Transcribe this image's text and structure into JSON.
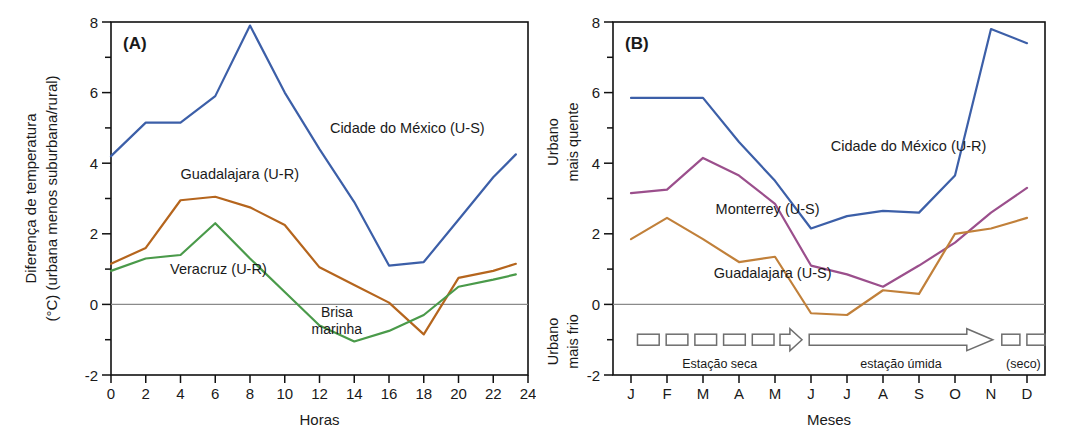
{
  "figure": {
    "panels": [
      "A",
      "B"
    ]
  },
  "panel_a": {
    "tag": "(A)",
    "ylabel_line1": "Diferença de temperatura",
    "ylabel_line2": "(°C) (urbana menos suburbana/rural)",
    "xlabel": "Horas",
    "yticks": [
      -2,
      0,
      2,
      4,
      6,
      8
    ],
    "yticks_minor": [
      -1,
      1,
      3,
      5,
      7
    ],
    "xticks": [
      0,
      2,
      4,
      6,
      8,
      10,
      12,
      14,
      16,
      18,
      20,
      22,
      24
    ],
    "ylim": [
      -2,
      8
    ],
    "xlim": [
      0,
      24
    ],
    "annotation": {
      "line1": "Brisa",
      "line2": "marinha",
      "x": 13.0,
      "y": -0.35
    },
    "series_labels": [
      {
        "text": "Cidade do México (U-S)",
        "x": 12.6,
        "y": 4.85
      },
      {
        "text": "Guadalajara (U-R)",
        "x": 4.0,
        "y": 3.55
      },
      {
        "text": "Veracruz (U-R)",
        "x": 3.4,
        "y": 0.85
      }
    ]
  },
  "panel_b": {
    "tag": "(B)",
    "ylabel_top_line1": "Urbano",
    "ylabel_top_line2": "mais quente",
    "ylabel_bottom_line1": "Urbano",
    "ylabel_bottom_line2": "mais frio",
    "xlabel": "Meses",
    "yticks": [
      -2,
      0,
      2,
      4,
      6,
      8
    ],
    "yticks_minor": [
      -1,
      1,
      3,
      5,
      7
    ],
    "xticks": [
      "J",
      "F",
      "M",
      "A",
      "M",
      "J",
      "J",
      "A",
      "S",
      "O",
      "N",
      "D"
    ],
    "ylim": [
      -2,
      8
    ],
    "series_labels": [
      {
        "text": "Cidade do México (U-R)",
        "x": 5.55,
        "y": 4.35
      },
      {
        "text": "Monterrey (U-S)",
        "x": 2.35,
        "y": 2.55
      },
      {
        "text": "Guadalajara (U-S)",
        "x": 2.3,
        "y": 0.75
      }
    ],
    "seasons": [
      {
        "name": "Estação seca",
        "type": "dashed-arrow",
        "x_start": 0.18,
        "x_end": 4.75,
        "dashes": 5
      },
      {
        "name": "estação úmida",
        "type": "solid-arrow",
        "x_start": 4.95,
        "x_end": 10.05,
        "dashes": 0
      },
      {
        "name": "(seco)",
        "type": "dashes",
        "x_start": 10.3,
        "x_end": 11.5,
        "dashes": 2
      }
    ],
    "season_band_y": -1.0
  },
  "chart_data": [
    {
      "type": "line",
      "panel": "A",
      "title": "(A) Diferença de temperatura urbana ao longo do dia",
      "xlabel": "Horas",
      "ylabel": "Diferença de temperatura (°C) (urbana menos suburbana/rural)",
      "xlim": [
        0,
        24
      ],
      "ylim": [
        -2,
        8
      ],
      "grid": false,
      "legend": "inline-annotations",
      "x": [
        0,
        2,
        4,
        6,
        8,
        10,
        12,
        14,
        16,
        18,
        20,
        22,
        23.3
      ],
      "series": [
        {
          "name": "Cidade do México (U-S)",
          "color": "#3c5fa8",
          "values": [
            4.2,
            5.15,
            5.15,
            5.9,
            7.9,
            6.0,
            4.4,
            2.9,
            1.1,
            1.2,
            2.4,
            3.6,
            4.25
          ]
        },
        {
          "name": "Guadalajara (U-R)",
          "color": "#b5651d",
          "values": [
            1.15,
            1.6,
            2.95,
            3.05,
            2.75,
            2.25,
            1.05,
            0.55,
            0.05,
            -0.85,
            0.75,
            0.95,
            1.15
          ]
        },
        {
          "name": "Veracruz (U-R)",
          "color": "#4a9a4a",
          "values": [
            0.95,
            1.3,
            1.4,
            2.3,
            1.3,
            0.35,
            -0.6,
            -1.05,
            -0.75,
            -0.3,
            0.5,
            0.7,
            0.85
          ]
        }
      ],
      "annotations": [
        {
          "text": "Brisa marinha",
          "x": 13.0,
          "y": -0.35
        }
      ]
    },
    {
      "type": "line",
      "panel": "B",
      "title": "(B) Diferença de temperatura urbana ao longo do ano",
      "xlabel": "Meses",
      "ylabel": "Urbano mais quente / Urbano mais frio (°C)",
      "ylim": [
        -2,
        8
      ],
      "grid": false,
      "legend": "inline-annotations",
      "categories": [
        "J",
        "F",
        "M",
        "A",
        "M",
        "J",
        "J",
        "A",
        "S",
        "O",
        "N",
        "D"
      ],
      "series": [
        {
          "name": "Cidade do México (U-R)",
          "color": "#3c5fa8",
          "values": [
            5.85,
            5.85,
            5.85,
            4.6,
            3.5,
            2.15,
            2.5,
            2.65,
            2.6,
            3.65,
            7.8,
            7.4
          ]
        },
        {
          "name": "Monterrey (U-S)",
          "color": "#9b4f8c",
          "values": [
            3.15,
            3.25,
            4.15,
            3.65,
            2.85,
            1.1,
            0.85,
            0.5,
            1.1,
            1.75,
            2.6,
            3.3
          ]
        },
        {
          "name": "Guadalajara (U-S)",
          "color": "#c1803a",
          "values": [
            1.85,
            2.45,
            1.85,
            1.2,
            1.35,
            -0.25,
            -0.3,
            0.4,
            0.3,
            2.0,
            2.15,
            2.45
          ]
        }
      ],
      "annotations": [
        {
          "text": "Estação seca",
          "x": 2.0,
          "y": -1.5
        },
        {
          "text": "estação úmida",
          "x": 7.3,
          "y": -1.5
        },
        {
          "text": "(seco)",
          "x": 10.9,
          "y": -1.5
        }
      ]
    }
  ]
}
